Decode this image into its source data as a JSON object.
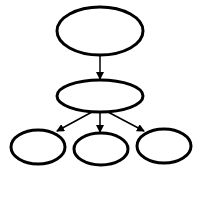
{
  "diagram": {
    "type": "tree",
    "background": "#ffffff",
    "stroke_color": "#000000",
    "nodes": [
      {
        "id": "root",
        "label": "",
        "cx": 100,
        "cy": 31,
        "rx": 43,
        "ry": 24
      },
      {
        "id": "middle",
        "label": "",
        "cx": 100,
        "cy": 96,
        "rx": 43,
        "ry": 16
      },
      {
        "id": "child-left",
        "label": "",
        "cx": 38,
        "cy": 147,
        "rx": 27,
        "ry": 17
      },
      {
        "id": "child-center",
        "label": "",
        "cx": 101,
        "cy": 149,
        "rx": 27,
        "ry": 16
      },
      {
        "id": "child-right",
        "label": "",
        "cx": 164,
        "cy": 146,
        "rx": 27,
        "ry": 17
      }
    ],
    "edges": [
      {
        "from": "root",
        "to": "middle"
      },
      {
        "from": "middle",
        "to": "child-left"
      },
      {
        "from": "middle",
        "to": "child-center"
      },
      {
        "from": "middle",
        "to": "child-right"
      }
    ]
  }
}
